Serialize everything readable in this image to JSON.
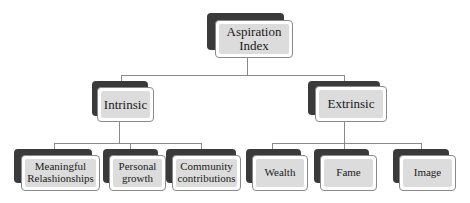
{
  "diagram": {
    "type": "hierarchy",
    "root": {
      "label": "Aspiration Index",
      "label_lines": [
        "Aspiration",
        "Index"
      ]
    },
    "branches": [
      {
        "label": "Intrinsic",
        "children": [
          {
            "label": "Meaningful Relashionships",
            "label_lines": [
              "Meaningful",
              "Relashionships"
            ]
          },
          {
            "label": "Personal growth",
            "label_lines": [
              "Personal",
              "growth"
            ]
          },
          {
            "label": "Community contributions",
            "label_lines": [
              "Community",
              "contributions"
            ]
          }
        ]
      },
      {
        "label": "Extrinsic",
        "children": [
          {
            "label": "Wealth",
            "label_lines": [
              "Wealth"
            ]
          },
          {
            "label": "Fame",
            "label_lines": [
              "Fame"
            ]
          },
          {
            "label": "Image",
            "label_lines": [
              "Image"
            ]
          }
        ]
      }
    ],
    "colors": {
      "shadow": "#3a3a3a",
      "fill": "#dcdcdc",
      "border": "#8a8a8a",
      "connector": "#8a8a8a",
      "text": "#1a1a1a"
    }
  }
}
